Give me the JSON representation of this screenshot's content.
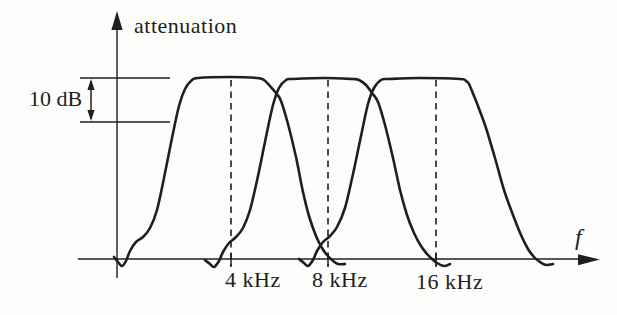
{
  "figure": {
    "background": "#fdfdfb",
    "ink_color": "#201f1d",
    "y_axis_label": "attenuation",
    "x_axis_label": "f",
    "attenuation_span_label": "10 dB"
  },
  "chart_data": {
    "type": "line",
    "xlabel": "f",
    "ylabel": "attenuation",
    "x_scale": "logarithmic, octave-spaced ticks",
    "grid": false,
    "legend": "none",
    "x_ticks": [
      {
        "label": "4 kHz",
        "value_kHz": 4,
        "px": 231
      },
      {
        "label": "8 kHz",
        "value_kHz": 8,
        "px": 328
      },
      {
        "label": "16 kHz",
        "value_kHz": 16,
        "px": 436
      }
    ],
    "annotations": [
      {
        "text": "10 dB",
        "type": "double-arrow-span",
        "meaning": "vertical distance between the two horizontal reference lines marking the passband top"
      }
    ],
    "series": [
      {
        "name": "band-pass filter centered at 4 kHz",
        "center_kHz": 4,
        "flat_top": true,
        "skirts_reach_zero_at_adjacent_octaves": true
      },
      {
        "name": "band-pass filter centered at 8 kHz",
        "center_kHz": 8,
        "flat_top": true,
        "skirts_reach_zero_at_adjacent_octaves": true
      },
      {
        "name": "band-pass filter centered at 16 kHz",
        "center_kHz": 16,
        "flat_top": true,
        "skirts_reach_zero_at_adjacent_octaves": true
      }
    ],
    "reference_lines_px": {
      "top_y": 78,
      "bottom_y": 122,
      "x_start": 80,
      "x_end": 170,
      "arrow_x": 91
    },
    "axes_px": {
      "y_axis_x": 117,
      "y_axis_top": 11,
      "y_axis_bottom": 278,
      "x_axis_y": 259,
      "x_axis_left": 78,
      "x_axis_right": 599
    },
    "dashed_lines_px": {
      "y_top": 80,
      "y_bottom": 266
    },
    "curves_px": [
      {
        "name": "filter-4khz",
        "points": [
          [
            114,
            257
          ],
          [
            118,
            262
          ],
          [
            122,
            266
          ],
          [
            126,
            261
          ],
          [
            130,
            251
          ],
          [
            136,
            242
          ],
          [
            143,
            237
          ],
          [
            150,
            228
          ],
          [
            157,
            210
          ],
          [
            164,
            178
          ],
          [
            172,
            138
          ],
          [
            179,
            106
          ],
          [
            185,
            89
          ],
          [
            191,
            81
          ],
          [
            198,
            78
          ],
          [
            230,
            77
          ],
          [
            257,
            78
          ],
          [
            264,
            80
          ],
          [
            270,
            86
          ],
          [
            276,
            93
          ],
          [
            281,
            101
          ],
          [
            288,
            124
          ],
          [
            296,
            157
          ],
          [
            303,
            192
          ],
          [
            309,
            216
          ],
          [
            316,
            236
          ],
          [
            322,
            248
          ],
          [
            327,
            255
          ],
          [
            332,
            260
          ],
          [
            338,
            264
          ],
          [
            345,
            264
          ]
        ]
      },
      {
        "name": "filter-8khz",
        "points": [
          [
            205,
            260
          ],
          [
            210,
            264
          ],
          [
            214,
            267
          ],
          [
            219,
            261
          ],
          [
            223,
            252
          ],
          [
            229,
            243
          ],
          [
            236,
            237
          ],
          [
            243,
            228
          ],
          [
            250,
            210
          ],
          [
            258,
            176
          ],
          [
            266,
            137
          ],
          [
            273,
            105
          ],
          [
            279,
            88
          ],
          [
            286,
            80
          ],
          [
            293,
            79
          ],
          [
            325,
            78
          ],
          [
            352,
            79
          ],
          [
            359,
            80
          ],
          [
            366,
            85
          ],
          [
            372,
            93
          ],
          [
            378,
            102
          ],
          [
            385,
            125
          ],
          [
            393,
            158
          ],
          [
            400,
            190
          ],
          [
            407,
            215
          ],
          [
            414,
            233
          ],
          [
            421,
            246
          ],
          [
            427,
            254
          ],
          [
            432,
            259
          ],
          [
            437,
            263
          ],
          [
            444,
            266
          ],
          [
            450,
            264
          ]
        ]
      },
      {
        "name": "filter-16khz",
        "points": [
          [
            299,
            259
          ],
          [
            304,
            263
          ],
          [
            308,
            266
          ],
          [
            313,
            260
          ],
          [
            317,
            251
          ],
          [
            323,
            242
          ],
          [
            330,
            236
          ],
          [
            337,
            227
          ],
          [
            345,
            208
          ],
          [
            353,
            174
          ],
          [
            361,
            136
          ],
          [
            368,
            104
          ],
          [
            374,
            88
          ],
          [
            381,
            80
          ],
          [
            389,
            79
          ],
          [
            420,
            78
          ],
          [
            460,
            79
          ],
          [
            466,
            81
          ],
          [
            469,
            84
          ],
          [
            474,
            96
          ],
          [
            478,
            106
          ],
          [
            486,
            128
          ],
          [
            495,
            158
          ],
          [
            504,
            190
          ],
          [
            513,
            215
          ],
          [
            521,
            235
          ],
          [
            528,
            249
          ],
          [
            534,
            257
          ],
          [
            540,
            262
          ],
          [
            546,
            265
          ],
          [
            553,
            264
          ]
        ]
      }
    ]
  }
}
